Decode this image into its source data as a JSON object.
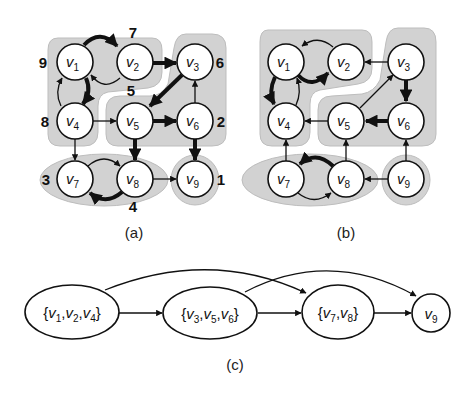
{
  "figure": {
    "panels": [
      {
        "id": "a",
        "caption": "(a)",
        "nodes": [
          {
            "id": "v1",
            "label": "v",
            "sub": "1",
            "order": "9"
          },
          {
            "id": "v2",
            "label": "v",
            "sub": "2",
            "order": "7"
          },
          {
            "id": "v3",
            "label": "v",
            "sub": "3",
            "order": "6"
          },
          {
            "id": "v4",
            "label": "v",
            "sub": "4",
            "order": "8"
          },
          {
            "id": "v5",
            "label": "v",
            "sub": "5",
            "order": "5"
          },
          {
            "id": "v6",
            "label": "v",
            "sub": "6",
            "order": "2"
          },
          {
            "id": "v7",
            "label": "v",
            "sub": "7",
            "order": "3"
          },
          {
            "id": "v8",
            "label": "v",
            "sub": "8",
            "order": "4"
          },
          {
            "id": "v9",
            "label": "v",
            "sub": "9",
            "order": "1"
          }
        ],
        "edges": [
          {
            "from": "v1",
            "to": "v2",
            "style": "thick"
          },
          {
            "from": "v2",
            "to": "v1",
            "style": "thin"
          },
          {
            "from": "v1",
            "to": "v4",
            "style": "thick"
          },
          {
            "from": "v4",
            "to": "v1",
            "style": "thin"
          },
          {
            "from": "v2",
            "to": "v3",
            "style": "thick"
          },
          {
            "from": "v3",
            "to": "v5",
            "style": "thick"
          },
          {
            "from": "v4",
            "to": "v5",
            "style": "thin"
          },
          {
            "from": "v5",
            "to": "v6",
            "style": "thick"
          },
          {
            "from": "v6",
            "to": "v3",
            "style": "thin"
          },
          {
            "from": "v4",
            "to": "v7",
            "style": "thin"
          },
          {
            "from": "v5",
            "to": "v8",
            "style": "thick"
          },
          {
            "from": "v6",
            "to": "v9",
            "style": "thick"
          },
          {
            "from": "v7",
            "to": "v8",
            "style": "thin"
          },
          {
            "from": "v8",
            "to": "v7",
            "style": "thick"
          },
          {
            "from": "v8",
            "to": "v9",
            "style": "thin"
          }
        ],
        "components": [
          [
            "v1",
            "v2",
            "v4"
          ],
          [
            "v3",
            "v5",
            "v6"
          ],
          [
            "v7",
            "v8"
          ],
          [
            "v9"
          ]
        ]
      },
      {
        "id": "b",
        "caption": "(b)",
        "nodes": [
          {
            "id": "v1",
            "label": "v",
            "sub": "1"
          },
          {
            "id": "v2",
            "label": "v",
            "sub": "2"
          },
          {
            "id": "v3",
            "label": "v",
            "sub": "3"
          },
          {
            "id": "v4",
            "label": "v",
            "sub": "4"
          },
          {
            "id": "v5",
            "label": "v",
            "sub": "5"
          },
          {
            "id": "v6",
            "label": "v",
            "sub": "6"
          },
          {
            "id": "v7",
            "label": "v",
            "sub": "7"
          },
          {
            "id": "v8",
            "label": "v",
            "sub": "8"
          },
          {
            "id": "v9",
            "label": "v",
            "sub": "9"
          }
        ],
        "edges": [
          {
            "from": "v2",
            "to": "v1",
            "style": "thin"
          },
          {
            "from": "v1",
            "to": "v2",
            "style": "thick"
          },
          {
            "from": "v1",
            "to": "v4",
            "style": "thick"
          },
          {
            "from": "v4",
            "to": "v1",
            "style": "thin"
          },
          {
            "from": "v3",
            "to": "v2",
            "style": "thin"
          },
          {
            "from": "v5",
            "to": "v3",
            "style": "thin"
          },
          {
            "from": "v3",
            "to": "v6",
            "style": "thick"
          },
          {
            "from": "v5",
            "to": "v4",
            "style": "thin"
          },
          {
            "from": "v6",
            "to": "v5",
            "style": "thick"
          },
          {
            "from": "v7",
            "to": "v4",
            "style": "thin"
          },
          {
            "from": "v8",
            "to": "v5",
            "style": "thin"
          },
          {
            "from": "v9",
            "to": "v6",
            "style": "thin"
          },
          {
            "from": "v8",
            "to": "v7",
            "style": "thick"
          },
          {
            "from": "v7",
            "to": "v8",
            "style": "thin"
          },
          {
            "from": "v9",
            "to": "v8",
            "style": "thin"
          }
        ]
      },
      {
        "id": "c",
        "caption": "(c)",
        "nodes": [
          {
            "id": "c1",
            "text": "{v1,v2,v4}",
            "parts": [
              "v",
              "1",
              "v",
              "2",
              "v",
              "4"
            ]
          },
          {
            "id": "c2",
            "text": "{v3,v5,v6}",
            "parts": [
              "v",
              "3",
              "v",
              "5",
              "v",
              "6"
            ]
          },
          {
            "id": "c3",
            "text": "{v7,v8}",
            "parts": [
              "v",
              "7",
              "v",
              "8"
            ]
          },
          {
            "id": "c4",
            "text": "v9",
            "parts": [
              "v",
              "9"
            ]
          }
        ],
        "edges": [
          {
            "from": "c1",
            "to": "c2"
          },
          {
            "from": "c2",
            "to": "c3"
          },
          {
            "from": "c3",
            "to": "c4"
          },
          {
            "from": "c1",
            "to": "c3"
          },
          {
            "from": "c2",
            "to": "c4"
          }
        ]
      }
    ]
  },
  "colors": {
    "region_fill": "#d2d2d2",
    "node_fill": "#ffffff",
    "stroke": "#111111"
  }
}
